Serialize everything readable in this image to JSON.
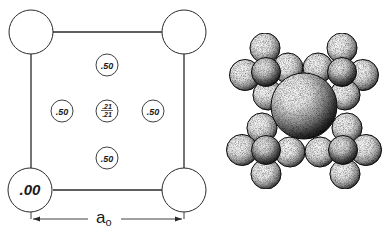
{
  "diagram": {
    "type": "crystal-structure",
    "left_panel": {
      "description": "unit cell projection",
      "corner_atoms": [
        {
          "position": "top-left",
          "label": ""
        },
        {
          "position": "top-right",
          "label": ""
        },
        {
          "position": "bottom-left",
          "label": ".00"
        },
        {
          "position": "bottom-right",
          "label": ""
        }
      ],
      "face_atoms": [
        {
          "position": "top",
          "label": ".50"
        },
        {
          "position": "left",
          "label": ".50"
        },
        {
          "position": "right",
          "label": ".50"
        },
        {
          "position": "bottom",
          "label": ".50"
        }
      ],
      "center_atom": {
        "label_top": ".21",
        "label_bottom": ".21"
      },
      "dimension": {
        "symbol": "a",
        "subscript": "o"
      }
    },
    "right_panel": {
      "description": "space-filling sphere model",
      "central_sphere": "large",
      "clusters": [
        "top-left",
        "top-right",
        "bottom-left",
        "bottom-right"
      ]
    }
  },
  "colors": {
    "line": "#2a2a2a",
    "background": "#ffffff",
    "sphere_shadow": "#111111"
  }
}
